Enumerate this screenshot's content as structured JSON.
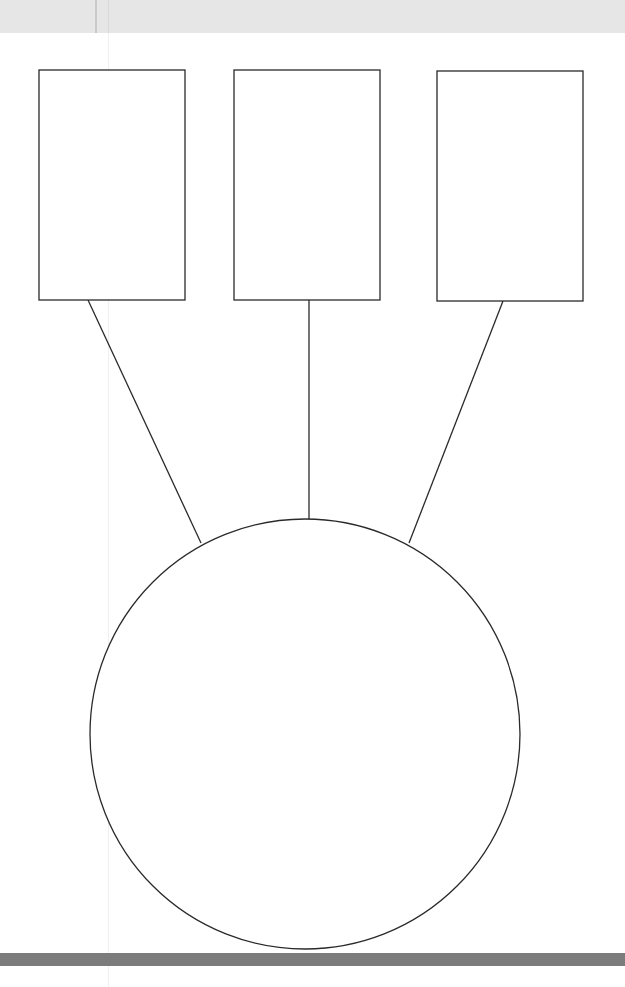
{
  "diagram": {
    "type": "organizer",
    "boxes": [
      {
        "id": "box-1",
        "x": 39,
        "y": 70,
        "width": 146,
        "height": 230,
        "label": ""
      },
      {
        "id": "box-2",
        "x": 234,
        "y": 70,
        "width": 146,
        "height": 230,
        "label": ""
      },
      {
        "id": "box-3",
        "x": 437,
        "y": 71,
        "width": 146,
        "height": 230,
        "label": ""
      }
    ],
    "circle": {
      "id": "center-circle",
      "cx": 305,
      "cy": 734,
      "r": 215,
      "label": ""
    },
    "connectors": [
      {
        "from": "box-1",
        "to": "center-circle",
        "x1": 88,
        "y1": 300,
        "x2": 201,
        "y2": 543
      },
      {
        "from": "box-2",
        "to": "center-circle",
        "x1": 309,
        "y1": 300,
        "x2": 309,
        "y2": 519
      },
      {
        "from": "box-3",
        "to": "center-circle",
        "x1": 503,
        "y1": 301,
        "x2": 409,
        "y2": 543
      }
    ],
    "colors": {
      "stroke": "#2a2a2a",
      "fill": "#ffffff",
      "top_band": "#e6e6e6",
      "bottom_bar": "#7c7c7c"
    }
  }
}
